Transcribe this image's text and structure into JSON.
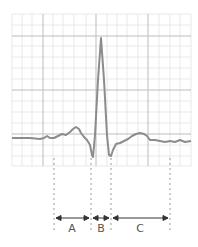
{
  "diagram": {
    "type": "ecg-waveform-intervals",
    "grid": {
      "x0": 12,
      "y0": 14,
      "x1": 191,
      "y1": 166,
      "minor_step": 10,
      "major_every": 3
    },
    "colors": {
      "grid_minor": "#e3e3e3",
      "grid_major": "#bdbdbd",
      "trace": "#8c8c8c",
      "dash": "#9a9a9a",
      "arrow": "#333333",
      "label": "#555555"
    },
    "markers_x": [
      54,
      91,
      111,
      170
    ],
    "intervals": [
      {
        "label": "A",
        "from": 54,
        "to": 91
      },
      {
        "label": "B",
        "from": 91,
        "to": 111
      },
      {
        "label": "C",
        "from": 111,
        "to": 170
      }
    ]
  },
  "labels": {
    "a": "A",
    "b": "B",
    "c": "C"
  }
}
